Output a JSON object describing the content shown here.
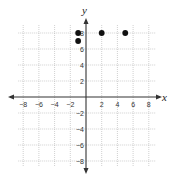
{
  "chart_data": {
    "type": "scatter",
    "title": "",
    "xlabel": "x",
    "ylabel": "y",
    "xlim": [
      -8,
      8
    ],
    "ylim": [
      -8,
      8
    ],
    "grid": true,
    "grid_step": 1,
    "x_ticks": [
      -8,
      -6,
      -4,
      -2,
      2,
      4,
      6,
      8
    ],
    "y_ticks": [
      -8,
      -6,
      -4,
      -2,
      2,
      4,
      6,
      8
    ],
    "x_tick_labels": [
      "−8",
      "−6",
      "−4",
      "−2",
      "2",
      "4",
      "6",
      "8"
    ],
    "y_tick_labels": [
      "−8",
      "−6",
      "−4",
      "−2",
      "2",
      "4",
      "6",
      "8"
    ],
    "points": [
      {
        "x": -1,
        "y": 8
      },
      {
        "x": -1,
        "y": 7
      },
      {
        "x": 2,
        "y": 8
      },
      {
        "x": 5,
        "y": 8
      }
    ],
    "legend": null
  },
  "colors": {
    "axis": "#333333",
    "grid": "#b0b0b0",
    "point": "#111111"
  }
}
